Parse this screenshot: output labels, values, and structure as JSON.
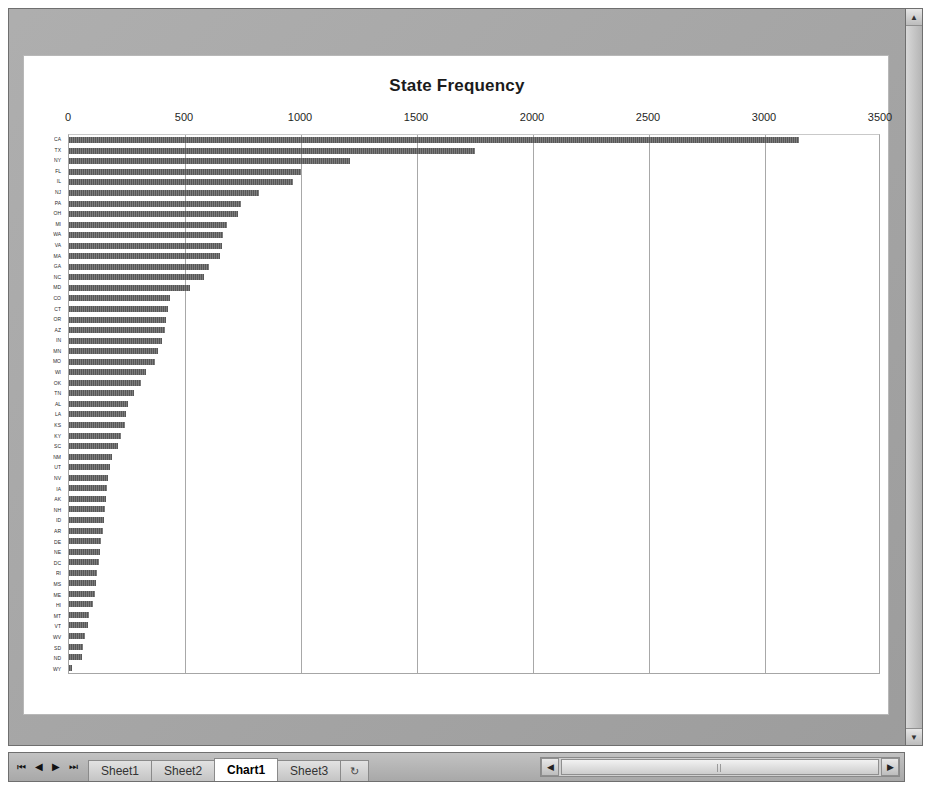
{
  "window": {
    "sheet_tab_bar": {
      "nav_first": "⏮",
      "nav_prev": "◀",
      "nav_next": "▶",
      "nav_last": "⏭",
      "tabs": [
        {
          "label": "Sheet1",
          "active": false
        },
        {
          "label": "Sheet2",
          "active": false
        },
        {
          "label": "Chart1",
          "active": true
        },
        {
          "label": "Sheet3",
          "active": false
        }
      ],
      "insert_tab_label": "↻"
    },
    "hscrollbar": {
      "left_arrow": "◀",
      "right_arrow": "▶"
    },
    "vscrollbar": {
      "up_arrow": "▲",
      "down_arrow": "▼"
    }
  },
  "chart_data": {
    "type": "bar",
    "orientation": "horizontal",
    "title": "State Frequency",
    "xlabel": "",
    "ylabel": "",
    "xlim": [
      0,
      3500
    ],
    "xticks": [
      0,
      500,
      1000,
      1500,
      2000,
      2500,
      3000,
      3500
    ],
    "tick_labels": [
      "0",
      "500",
      "1000",
      "1500",
      "2000",
      "2500",
      "3000",
      "3500"
    ],
    "grid": true,
    "grid_axis": "x",
    "legend": false,
    "bar_color": "#5f5f5f",
    "categories": [
      "CA",
      "TX",
      "NY",
      "FL",
      "IL",
      "NJ",
      "PA",
      "OH",
      "MI",
      "WA",
      "VA",
      "MA",
      "GA",
      "NC",
      "MD",
      "CO",
      "CT",
      "OR",
      "AZ",
      "IN",
      "MN",
      "MO",
      "WI",
      "OK",
      "TN",
      "AL",
      "LA",
      "KS",
      "KY",
      "SC",
      "NM",
      "UT",
      "NV",
      "IA",
      "AK",
      "NH",
      "ID",
      "AR",
      "DE",
      "NE",
      "DC",
      "RI",
      "MS",
      "ME",
      "HI",
      "MT",
      "VT",
      "WV",
      "SD",
      "ND",
      "WY"
    ],
    "values": [
      3145,
      1750,
      1210,
      1000,
      965,
      820,
      740,
      730,
      680,
      665,
      660,
      650,
      605,
      580,
      520,
      435,
      425,
      420,
      415,
      400,
      385,
      370,
      330,
      310,
      280,
      255,
      245,
      240,
      225,
      210,
      185,
      175,
      170,
      165,
      160,
      155,
      150,
      145,
      140,
      135,
      130,
      120,
      115,
      110,
      105,
      85,
      80,
      70,
      60,
      55,
      15
    ]
  }
}
